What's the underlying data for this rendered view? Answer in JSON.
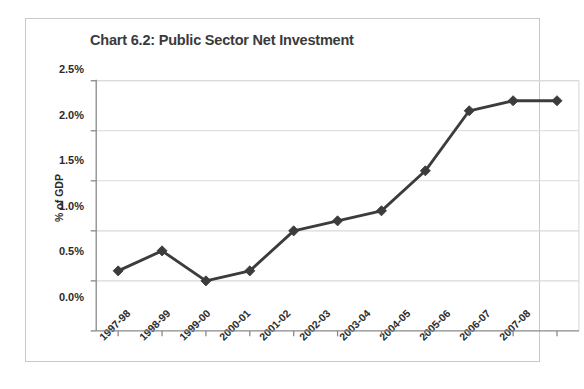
{
  "chart_data": {
    "type": "line",
    "title": "Chart 6.2: Public Sector Net Investment",
    "xlabel": "",
    "ylabel": "% of GDP",
    "categories": [
      "1997-98",
      "1998-99",
      "1999-00",
      "2000-01",
      "2001-02",
      "2002-03",
      "2003-04",
      "2004-05",
      "2005-06",
      "2006-07",
      "2007-08"
    ],
    "values": [
      0.6,
      0.8,
      0.5,
      0.6,
      1.0,
      1.1,
      1.2,
      1.6,
      2.2,
      2.3,
      2.3
    ],
    "ylim": [
      0.0,
      2.5
    ],
    "ytick_values": [
      0.0,
      0.5,
      1.0,
      1.5,
      2.0,
      2.5
    ],
    "ytick_labels": [
      "0.0%",
      "0.5%",
      "1.0%",
      "1.5%",
      "2.0%",
      "2.5%"
    ],
    "grid": "horizontal",
    "legend": "none",
    "marker": "diamond",
    "series_color": "#3c3c3c",
    "grid_color": "#d9d9d9",
    "axis_color": "#8a8a8a",
    "text_color": "#2b2b2b",
    "title_color": "#3a3a3a"
  }
}
